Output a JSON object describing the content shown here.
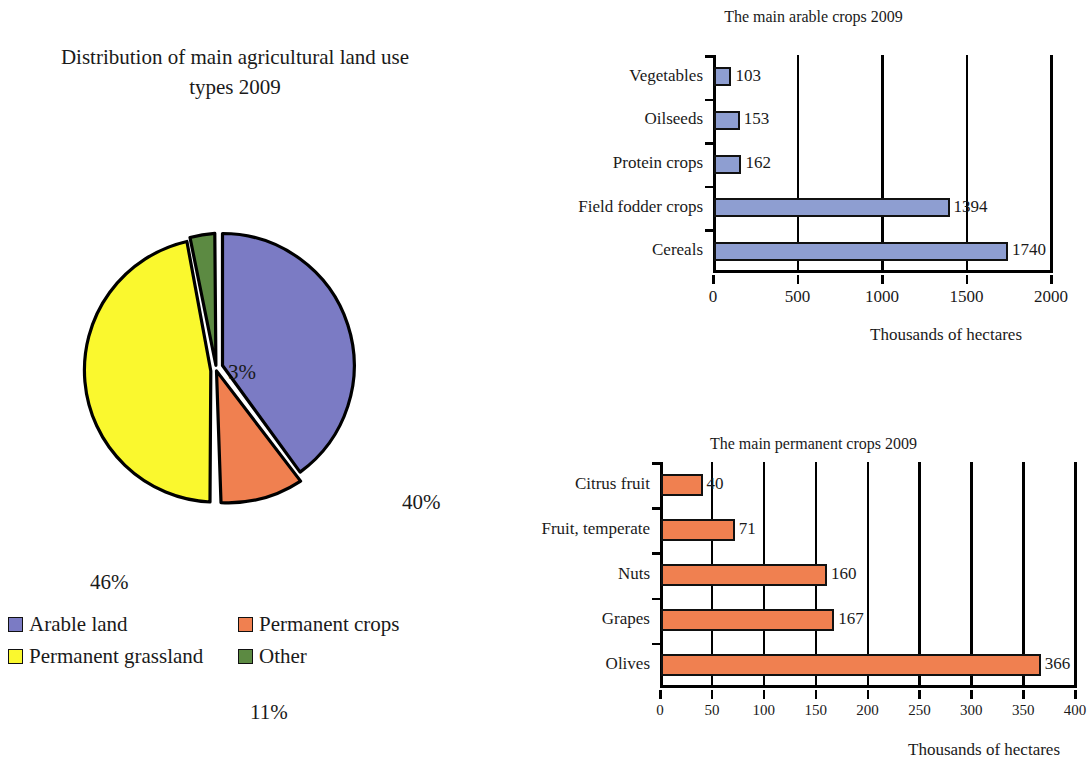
{
  "pie": {
    "title": "Distribution of main agricultural land use types 2009",
    "title_line1": "Distribution of main agricultural land use",
    "title_line2": "types 2009",
    "labels": {
      "arable": "40%",
      "permanent_crops": "11%",
      "permanent_grassland": "46%",
      "other": "3%"
    },
    "legend": [
      {
        "label": "Arable land",
        "color": "#7b7bc4"
      },
      {
        "label": "Permanent crops",
        "color": "#f08050"
      },
      {
        "label": "Permanent grassland",
        "color": "#faf82e"
      },
      {
        "label": "Other",
        "color": "#5c8a42"
      }
    ]
  },
  "chart_data": [
    {
      "type": "pie",
      "title": "Distribution of main agricultural land use types 2009",
      "categories": [
        "Arable land",
        "Permanent crops",
        "Permanent grassland",
        "Other"
      ],
      "values": [
        40,
        11,
        46,
        3
      ],
      "value_labels": [
        "40%",
        "11%",
        "46%",
        "3%"
      ],
      "colors": [
        "#7b7bc4",
        "#f08050",
        "#faf82e",
        "#5c8a42"
      ],
      "unit": "%",
      "legend_position": "bottom",
      "exploded": true
    },
    {
      "type": "bar",
      "orientation": "horizontal",
      "title": "The main arable crops 2009",
      "categories": [
        "Cereals",
        "Field fodder crops",
        "Protein crops",
        "Oilseeds",
        "Vegetables"
      ],
      "values": [
        1740,
        1394,
        162,
        153,
        103
      ],
      "value_labels": [
        "1740",
        "1394",
        "162",
        "153",
        "103"
      ],
      "xlabel": "Thousands of hectares",
      "ylabel": "",
      "xlim": [
        0,
        2000
      ],
      "xticks": [
        0,
        500,
        1000,
        1500,
        2000
      ],
      "xtick_labels": [
        "0",
        "500",
        "1000",
        "1500",
        "2000"
      ],
      "grid": true,
      "color": "#8e9ed1"
    },
    {
      "type": "bar",
      "orientation": "horizontal",
      "title": "The main permanent crops 2009",
      "categories": [
        "Olives",
        "Grapes",
        "Nuts",
        "Fruit, temperate",
        "Citrus fruit"
      ],
      "values": [
        366,
        167,
        160,
        71,
        40
      ],
      "value_labels": [
        "366",
        "167",
        "160",
        "71",
        "40"
      ],
      "xlabel": "Thousands of hectares",
      "ylabel": "",
      "xlim": [
        0,
        400
      ],
      "xticks": [
        0,
        50,
        100,
        150,
        200,
        250,
        300,
        350,
        400
      ],
      "xtick_labels": [
        "0",
        "50",
        "100",
        "150",
        "200",
        "250",
        "300",
        "350",
        "400"
      ],
      "grid": true,
      "color": "#f08050"
    }
  ]
}
